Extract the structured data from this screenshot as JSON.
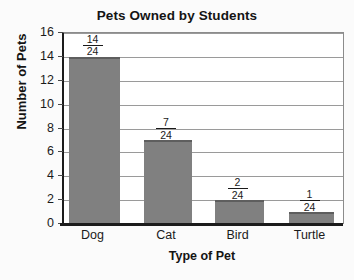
{
  "chart_data": {
    "type": "bar",
    "title": "Pets Owned by Students",
    "xlabel": "Type of Pet",
    "ylabel": "Number of Pets",
    "categories": [
      "Dog",
      "Cat",
      "Bird",
      "Turtle"
    ],
    "values": [
      14,
      7,
      2,
      1
    ],
    "bar_labels": [
      {
        "numerator": "14",
        "denominator": "24"
      },
      {
        "numerator": "7",
        "denominator": "24"
      },
      {
        "numerator": "2",
        "denominator": "24"
      },
      {
        "numerator": "1",
        "denominator": "24"
      }
    ],
    "ylim": [
      0,
      16
    ],
    "ytick_labels": [
      "16",
      "14",
      "12",
      "10",
      "8",
      "6",
      "4",
      "2",
      "0"
    ],
    "ytick_values": [
      16,
      14,
      12,
      10,
      8,
      6,
      4,
      2,
      0
    ],
    "grid": true,
    "legend": null,
    "bar_color": "#808080",
    "bar_edge_color": "#5e5e5e",
    "axis_color": "#1c1c1c",
    "grid_color": "#9a9a9a",
    "background_color": "#ffffff"
  }
}
